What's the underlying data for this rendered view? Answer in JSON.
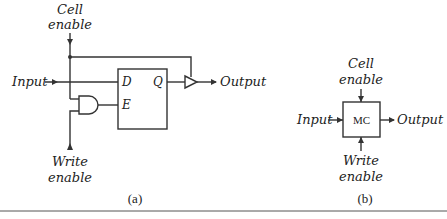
{
  "diagram_a": {
    "cell_enable_line1": "Cell",
    "cell_enable_line2": "enable",
    "input_label": "Input",
    "output_label": "Output",
    "write_enable_line1": "Write",
    "write_enable_line2": "enable",
    "flipflop_pin_d": "D",
    "flipflop_pin_e": "E",
    "flipflop_pin_q": "Q",
    "sublabel": "(a)"
  },
  "diagram_b": {
    "cell_enable_line1": "Cell",
    "cell_enable_line2": "enable",
    "input_label": "Input",
    "output_label": "Output",
    "write_enable_line1": "Write",
    "write_enable_line2": "enable",
    "block_label": "MC",
    "sublabel": "(b)"
  },
  "colors": {
    "line": "#333333",
    "text": "#222222",
    "background": "#ffffff"
  }
}
